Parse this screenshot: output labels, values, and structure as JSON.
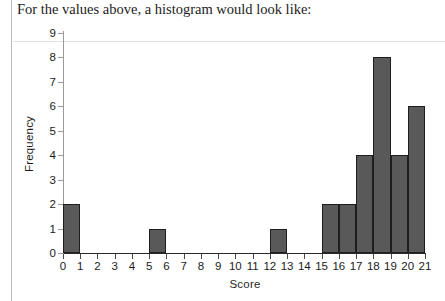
{
  "heading": "For the values above, a histogram would look like:",
  "colors": {
    "bar_fill": "#595959",
    "bar_outline": "#1e1e1e",
    "axis": "#2a2a2a",
    "text": "#1b1b1b",
    "background": "#ffffff"
  },
  "chart_data": {
    "type": "bar",
    "title": "",
    "xlabel": "Score",
    "ylabel": "Frequency",
    "xlim": [
      0,
      21
    ],
    "ylim": [
      0,
      9
    ],
    "grid": false,
    "legend": null,
    "x_ticks": [
      "0",
      "1",
      "2",
      "3",
      "4",
      "5",
      "6",
      "7",
      "8",
      "9",
      "10",
      "11",
      "12",
      "13",
      "14",
      "15",
      "16",
      "17",
      "18",
      "19",
      "20",
      "21"
    ],
    "y_ticks": [
      "0",
      "1",
      "2",
      "3",
      "4",
      "5",
      "6",
      "7",
      "8",
      "9"
    ],
    "bin_width": 1,
    "categories": [
      "0-1",
      "1-2",
      "2-3",
      "3-4",
      "4-5",
      "5-6",
      "6-7",
      "7-8",
      "8-9",
      "9-10",
      "10-11",
      "11-12",
      "12-13",
      "13-14",
      "14-15",
      "15-16",
      "16-17",
      "17-18",
      "18-19",
      "19-20",
      "20-21"
    ],
    "bin_starts": [
      0,
      1,
      2,
      3,
      4,
      5,
      6,
      7,
      8,
      9,
      10,
      11,
      12,
      13,
      14,
      15,
      16,
      17,
      18,
      19,
      20
    ],
    "values": [
      2,
      0,
      0,
      0,
      0,
      1,
      0,
      0,
      0,
      0,
      0,
      0,
      1,
      0,
      0,
      2,
      2,
      4,
      8,
      4,
      6
    ]
  }
}
